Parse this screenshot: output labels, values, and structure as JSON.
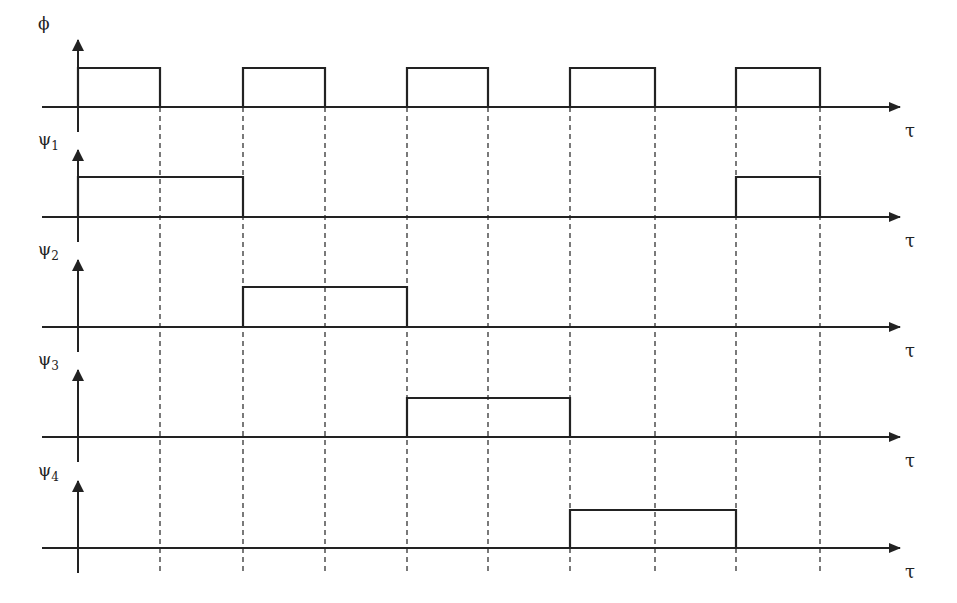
{
  "diagram": {
    "type": "timing-diagram",
    "x_axis_label": "τ",
    "gridlines_x": [
      160,
      243,
      325,
      407,
      488,
      570,
      655,
      736,
      820
    ],
    "axis_origin_x": 78,
    "axis_end_x": 900,
    "signals": [
      {
        "id": "phi",
        "label": "ϕ",
        "subscript": "",
        "baseline_y": 107,
        "high_y": 68,
        "high_intervals": [
          [
            78,
            160
          ],
          [
            243,
            325
          ],
          [
            407,
            488
          ],
          [
            570,
            655
          ],
          [
            736,
            820
          ]
        ]
      },
      {
        "id": "psi1",
        "label": "ψ",
        "subscript": "1",
        "baseline_y": 217,
        "high_y": 177,
        "high_intervals": [
          [
            78,
            243
          ],
          [
            736,
            820
          ]
        ]
      },
      {
        "id": "psi2",
        "label": "ψ",
        "subscript": "2",
        "baseline_y": 327,
        "high_y": 287,
        "high_intervals": [
          [
            243,
            407
          ]
        ]
      },
      {
        "id": "psi3",
        "label": "ψ",
        "subscript": "3",
        "baseline_y": 437,
        "high_y": 398,
        "high_intervals": [
          [
            407,
            570
          ]
        ]
      },
      {
        "id": "psi4",
        "label": "ψ",
        "subscript": "4",
        "baseline_y": 548,
        "high_y": 510,
        "high_intervals": [
          [
            570,
            736
          ]
        ]
      }
    ]
  }
}
